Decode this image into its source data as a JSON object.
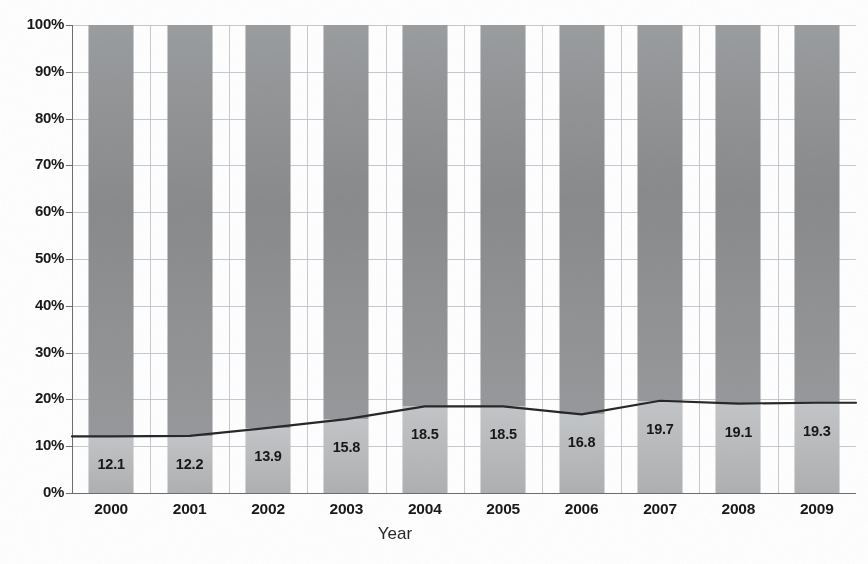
{
  "chart_data": {
    "type": "bar",
    "subtype": "100% stacked bar with overlaid line",
    "title": "",
    "xlabel": "Year",
    "ylabel": "",
    "ylim": [
      0,
      100
    ],
    "y_unit": "%",
    "grid": true,
    "legend": "none",
    "categories": [
      "2000",
      "2001",
      "2002",
      "2003",
      "2004",
      "2005",
      "2006",
      "2007",
      "2008",
      "2009"
    ],
    "values": [
      12.1,
      12.2,
      13.9,
      15.8,
      18.5,
      18.5,
      16.8,
      19.7,
      19.1,
      19.3
    ],
    "data_labels": [
      "12.1",
      "12.2",
      "13.9",
      "15.8",
      "18.5",
      "18.5",
      "16.8",
      "19.7",
      "19.1",
      "19.3"
    ],
    "series": [
      {
        "name": "lower-segment",
        "kind": "bar-segment",
        "values": [
          12.1,
          12.2,
          13.9,
          15.8,
          18.5,
          18.5,
          16.8,
          19.7,
          19.1,
          19.3
        ],
        "color": "#b4b6b8"
      },
      {
        "name": "upper-segment",
        "kind": "bar-segment",
        "values": [
          87.9,
          87.8,
          86.1,
          84.2,
          81.5,
          81.5,
          83.2,
          80.3,
          80.9,
          80.7
        ],
        "color": "#8d8f91"
      },
      {
        "name": "trend-line",
        "kind": "line",
        "values": [
          12.1,
          12.2,
          13.9,
          15.8,
          18.5,
          18.5,
          16.8,
          19.7,
          19.1,
          19.3
        ],
        "color": "#2b2b2b"
      }
    ],
    "y_ticks": [
      "0%",
      "10%",
      "20%",
      "30%",
      "40%",
      "50%",
      "60%",
      "70%",
      "80%",
      "90%",
      "100%"
    ],
    "y_tick_values": [
      0,
      10,
      20,
      30,
      40,
      50,
      60,
      70,
      80,
      90,
      100
    ]
  },
  "axis": {
    "x_title": "Year"
  },
  "caption": {
    "text": ""
  },
  "colors": {
    "segment_lower": "#b4b6b8",
    "segment_upper": "#8d8f91",
    "line": "#2b2b2b",
    "grid": "#b9bdc4",
    "axis": "#6d6d6d",
    "text": "#1d1d1d",
    "background": "#ffffff"
  }
}
